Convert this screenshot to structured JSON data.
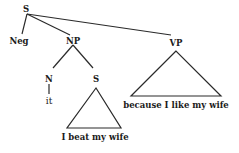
{
  "tree": {
    "root": {
      "label": "S"
    },
    "neg": {
      "label": "Neg"
    },
    "np": {
      "label": "NP"
    },
    "vp": {
      "label": "VP",
      "terminal": "because I like my wife"
    },
    "n": {
      "label": "N",
      "terminal": "it"
    },
    "s_embedded": {
      "label": "S",
      "terminal": "I beat my wife"
    }
  },
  "colors": {
    "line": "#2a2a2a",
    "text": "#1a1a1a",
    "background": "#ffffff"
  }
}
